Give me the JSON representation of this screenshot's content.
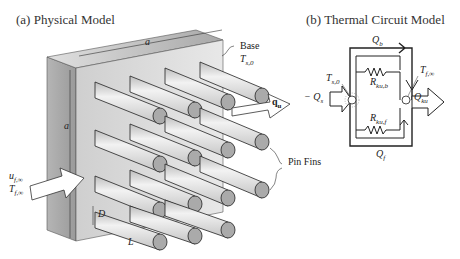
{
  "panel_a": {
    "title": "(a) Physical Model",
    "labels": {
      "base": "Base",
      "base_temp": "T",
      "base_temp_sub": "s,0",
      "a_top": "a",
      "a_side": "a",
      "q": "q",
      "q_sub": "u",
      "u_inf": "u",
      "u_inf_sub": "f,∞",
      "t_inf": "T",
      "t_inf_sub": "f,∞",
      "pin_fins": "Pin Fins",
      "D": "D",
      "L": "L"
    }
  },
  "panel_b": {
    "title": "(b) Thermal Circuit Model",
    "labels": {
      "Qb": "Q",
      "Qb_sub": "b",
      "Ts0": "T",
      "Ts0_sub": "s,0",
      "Tfinf": "T",
      "Tfinf_sub": "f,∞",
      "Rkub": "R",
      "Rkub_sub": "ku,b",
      "Rkuf": "R",
      "Rkuf_sub": "ku,f",
      "Qs": "− Q",
      "Qs_sub": "s",
      "Qku": "Q",
      "Qku_sub": "ku",
      "Qf": "Q",
      "Qf_sub": "f"
    }
  }
}
